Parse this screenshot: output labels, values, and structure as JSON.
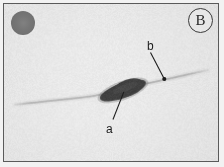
{
  "figure": {
    "panel_label": "B",
    "image_type": "grayscale micrograph",
    "background_color": "#e8e8e8",
    "frame_color": "#5a5a5a",
    "specimen_color": "#2b2b2b",
    "filament_color": "#c9c9c9"
  },
  "corner_marker": {
    "name": "circular-marker",
    "color": "#6f6f6f",
    "position": "top-left"
  },
  "annotations": [
    {
      "id": "a",
      "label": "a",
      "target": "dark elongated body",
      "label_x": 105,
      "label_y": 122,
      "leader_from_x": 113,
      "leader_from_y": 120,
      "leader_to_x": 124,
      "leader_to_y": 92
    },
    {
      "id": "b",
      "label": "b",
      "target": "thin filament point",
      "label_x": 146,
      "label_y": 39,
      "leader_from_x": 151,
      "leader_from_y": 52,
      "leader_to_x": 165,
      "leader_to_y": 79
    }
  ],
  "chart_data": {
    "type": "scatter",
    "title": "",
    "xlabel": "",
    "ylabel": "",
    "series": [
      {
        "name": "filament-axis",
        "x": [
          14,
          40,
          70,
          96,
          120,
          145,
          168,
          190,
          209
        ],
        "y": [
          105,
          102,
          99,
          96,
          90,
          84,
          79,
          74,
          70
        ]
      },
      {
        "name": "dark-body-extent",
        "x": [
          100,
          146
        ],
        "y": [
          99,
          82
        ]
      }
    ]
  }
}
